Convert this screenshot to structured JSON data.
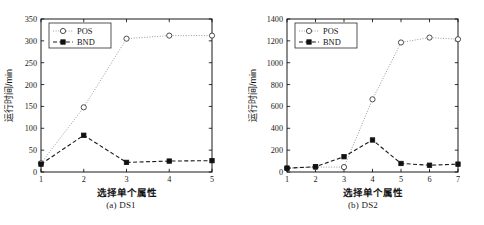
{
  "figure": {
    "background": "#ffffff",
    "panels": 2
  },
  "chart_data": [
    {
      "type": "line",
      "title": "",
      "caption": "(a) DS1",
      "xlabel": "选择单个属性",
      "ylabel": "运行时间/min",
      "x": [
        1,
        2,
        3,
        4,
        5
      ],
      "xticklabels": [
        "1",
        "2",
        "3",
        "4",
        "5"
      ],
      "xlim": [
        1,
        5
      ],
      "ylim": [
        0,
        350
      ],
      "yticks": [
        0,
        50,
        100,
        150,
        200,
        250,
        300,
        350
      ],
      "yticklabels": [
        "0",
        "50",
        "100",
        "150",
        "200",
        "250",
        "300",
        "350"
      ],
      "grid": false,
      "legend_position": "top-left",
      "series": [
        {
          "name": "POS",
          "values": [
            20,
            148,
            305,
            312,
            312
          ],
          "marker": "open-circle",
          "linestyle": "dotted",
          "color": "#9a9a9a"
        },
        {
          "name": "BND",
          "values": [
            18,
            84,
            22,
            25,
            26
          ],
          "marker": "filled-square",
          "linestyle": "dashed",
          "color": "#1a1a1a"
        }
      ]
    },
    {
      "type": "line",
      "title": "",
      "caption": "(b) DS2",
      "xlabel": "选择单个属性",
      "ylabel": "运行时间/min",
      "x": [
        1,
        2,
        3,
        4,
        5,
        6,
        7
      ],
      "xticklabels": [
        "1",
        "2",
        "3",
        "4",
        "5",
        "6",
        "7"
      ],
      "xlim": [
        1,
        7
      ],
      "ylim": [
        0,
        1400
      ],
      "yticks": [
        0,
        200,
        400,
        600,
        800,
        1000,
        1200,
        1400
      ],
      "yticklabels": [
        "0",
        "200",
        "400",
        "600",
        "800",
        "1000",
        "1200",
        "1400"
      ],
      "grid": false,
      "legend_position": "top-left",
      "series": [
        {
          "name": "POS",
          "values": [
            35,
            45,
            45,
            665,
            1185,
            1230,
            1215
          ],
          "marker": "open-circle",
          "linestyle": "dotted",
          "color": "#9a9a9a"
        },
        {
          "name": "BND",
          "values": [
            35,
            48,
            140,
            293,
            78,
            62,
            72
          ],
          "marker": "filled-square",
          "linestyle": "dashed",
          "color": "#1a1a1a"
        }
      ]
    }
  ]
}
